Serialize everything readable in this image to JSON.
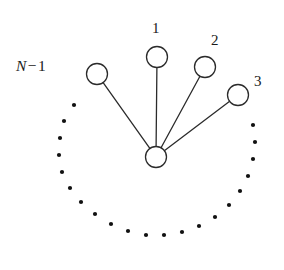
{
  "figure": {
    "type": "star-graph-diagram",
    "title": "",
    "background_color": "#ffffff",
    "stroke_color": "#2b2b2b",
    "dot_color": "#111111",
    "width": 284,
    "height": 270
  },
  "hub": {
    "label": "",
    "cx": 156,
    "cy": 157,
    "r": 10.5
  },
  "nodes": [
    {
      "id": "node-n-minus-1",
      "label": "N − 1",
      "label_parts": {
        "variable": "N",
        "operator": "−",
        "number": "1"
      },
      "cx": 97,
      "cy": 74,
      "r": 10.5,
      "label_x": 16,
      "label_y": 58
    },
    {
      "id": "node-1",
      "label": "1",
      "cx": 157,
      "cy": 57,
      "r": 10.5,
      "label_x": 152,
      "label_y": 21
    },
    {
      "id": "node-2",
      "label": "2",
      "cx": 205,
      "cy": 67,
      "r": 10.5,
      "label_x": 211,
      "label_y": 33
    },
    {
      "id": "node-3",
      "label": "3",
      "cx": 238,
      "cy": 95,
      "r": 10.5,
      "label_x": 254,
      "label_y": 74
    }
  ],
  "edges": [
    {
      "id": "edge-hub-n-minus-1",
      "from": "hub",
      "to": "node-n-minus-1"
    },
    {
      "id": "edge-hub-1",
      "from": "hub",
      "to": "node-1"
    },
    {
      "id": "edge-hub-2",
      "from": "hub",
      "to": "node-2"
    },
    {
      "id": "edge-hub-3",
      "from": "hub",
      "to": "node-3"
    }
  ],
  "ellipsis_arc": {
    "description": "dotted arc of remaining nodes",
    "center": [
      157,
      152
    ],
    "radius": 95,
    "dot_radius": 2.1,
    "dots": [
      [
        74,
        105
      ],
      [
        64,
        121
      ],
      [
        60,
        138
      ],
      [
        59,
        155
      ],
      [
        62,
        172
      ],
      [
        70,
        188
      ],
      [
        81,
        202
      ],
      [
        95,
        214
      ],
      [
        111,
        224
      ],
      [
        128,
        231
      ],
      [
        146,
        235
      ],
      [
        164,
        235
      ],
      [
        182,
        232
      ],
      [
        199,
        226
      ],
      [
        215,
        217
      ],
      [
        229,
        205
      ],
      [
        240,
        191
      ],
      [
        248,
        176
      ],
      [
        253,
        159
      ],
      [
        255,
        142
      ],
      [
        253,
        125
      ]
    ]
  },
  "chart_data": {
    "type": "scatter",
    "title": "",
    "xlabel": "",
    "ylabel": "",
    "labels": [
      "1",
      "2",
      "3",
      "N − 1"
    ],
    "node_count_label": "N − 1",
    "explicit_nodes": 4,
    "ellipsis_dots": 21,
    "edges": 4
  }
}
